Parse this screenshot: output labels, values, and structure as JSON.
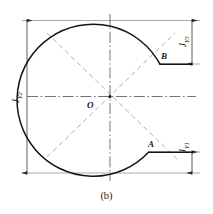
{
  "figure": {
    "caption": "(b)",
    "center_point_label": "O",
    "point_labels": [
      {
        "id": "A",
        "text": "A"
      },
      {
        "id": "B",
        "text": "B"
      }
    ],
    "dimensions": [
      {
        "id": "JY2",
        "base": "J",
        "subscript": "Y2",
        "orientation": "vertical-left"
      },
      {
        "id": "JY3",
        "base": "J",
        "subscript": "Y3",
        "orientation": "vertical-right-upper"
      },
      {
        "id": "JY1",
        "base": "J",
        "subscript": "Y1",
        "orientation": "vertical-right-lower"
      }
    ],
    "colors": {
      "outline": "#1b1b1b",
      "centerline": "#55575a",
      "dashed_diagonal": "#9a9a9a",
      "dimension_line": "#3a3a3a",
      "background": "#ffffff",
      "text": "#1b1b1b"
    }
  }
}
